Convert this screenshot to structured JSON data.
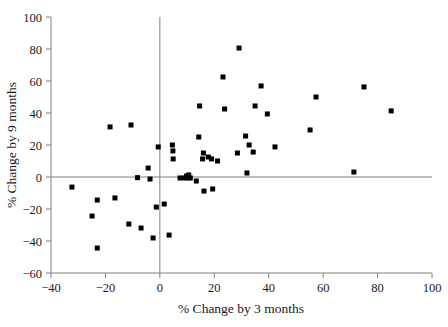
{
  "chart_data": {
    "type": "scatter",
    "title": "",
    "xlabel": "% Change by 3 months",
    "ylabel": "% Change by 9 months",
    "xlim": [
      -40,
      100
    ],
    "ylim": [
      -60,
      100
    ],
    "xticks": [
      -40,
      -20,
      0,
      20,
      40,
      60,
      80,
      100
    ],
    "xticklabels": [
      "−40",
      "−20",
      "0",
      "20",
      "40",
      "60",
      "80",
      "100"
    ],
    "yticks": [
      -60,
      -40,
      -20,
      0,
      20,
      40,
      60,
      80,
      100
    ],
    "yticklabels": [
      "−60",
      "−40",
      "−20",
      "0",
      "20",
      "40",
      "60",
      "80",
      "100"
    ],
    "grid": false,
    "legend": null,
    "marker": {
      "shape": "square",
      "color": "#000000",
      "size_px": 5
    },
    "reference_lines": {
      "horizontal_at_y": 0,
      "vertical_at_x": 0,
      "color": "#808080"
    },
    "points": [
      {
        "x": -32.3,
        "y": -6.3
      },
      {
        "x": -23.0,
        "y": -14.4
      },
      {
        "x": -23.0,
        "y": -44.4
      },
      {
        "x": -24.9,
        "y": -24.4
      },
      {
        "x": -18.3,
        "y": 31.3
      },
      {
        "x": -16.5,
        "y": -13.1
      },
      {
        "x": -11.4,
        "y": -29.4
      },
      {
        "x": -10.6,
        "y": 32.5
      },
      {
        "x": -8.2,
        "y": -0.4
      },
      {
        "x": -6.9,
        "y": -31.9
      },
      {
        "x": -4.3,
        "y": 5.6
      },
      {
        "x": -3.6,
        "y": -1.3
      },
      {
        "x": -2.5,
        "y": -38.1
      },
      {
        "x": -1.3,
        "y": -18.8
      },
      {
        "x": -0.6,
        "y": 18.8
      },
      {
        "x": 1.6,
        "y": -16.9
      },
      {
        "x": 3.4,
        "y": -36.3
      },
      {
        "x": 4.6,
        "y": 20.0
      },
      {
        "x": 4.8,
        "y": 16.3
      },
      {
        "x": 4.9,
        "y": 11.3
      },
      {
        "x": 7.4,
        "y": -0.6
      },
      {
        "x": 8.9,
        "y": -0.6
      },
      {
        "x": 9.8,
        "y": 0.6
      },
      {
        "x": 10.3,
        "y": -0.6
      },
      {
        "x": 10.6,
        "y": 1.3
      },
      {
        "x": 11.2,
        "y": -0.6
      },
      {
        "x": 13.4,
        "y": -2.5
      },
      {
        "x": 14.3,
        "y": 25.0
      },
      {
        "x": 14.6,
        "y": 44.4
      },
      {
        "x": 15.7,
        "y": 11.3
      },
      {
        "x": 16.0,
        "y": 15.0
      },
      {
        "x": 16.2,
        "y": -8.8
      },
      {
        "x": 17.8,
        "y": 12.5
      },
      {
        "x": 19.0,
        "y": 11.3
      },
      {
        "x": 19.4,
        "y": -7.5
      },
      {
        "x": 21.2,
        "y": 10.0
      },
      {
        "x": 23.2,
        "y": 62.5
      },
      {
        "x": 23.8,
        "y": 42.5
      },
      {
        "x": 28.5,
        "y": 15.0
      },
      {
        "x": 29.1,
        "y": 80.6
      },
      {
        "x": 31.5,
        "y": 25.6
      },
      {
        "x": 32.0,
        "y": 2.5
      },
      {
        "x": 32.8,
        "y": 20.0
      },
      {
        "x": 34.3,
        "y": 15.6
      },
      {
        "x": 35.0,
        "y": 44.4
      },
      {
        "x": 37.2,
        "y": 56.9
      },
      {
        "x": 39.5,
        "y": 39.4
      },
      {
        "x": 42.3,
        "y": 18.8
      },
      {
        "x": 55.2,
        "y": 29.4
      },
      {
        "x": 57.4,
        "y": 50.0
      },
      {
        "x": 71.3,
        "y": 3.1
      },
      {
        "x": 75.0,
        "y": 56.3
      },
      {
        "x": 85.0,
        "y": 41.3
      }
    ]
  },
  "figure": {
    "background": "#ffffff",
    "axis_color": "#808080",
    "text_color": "#1a1a1a"
  }
}
